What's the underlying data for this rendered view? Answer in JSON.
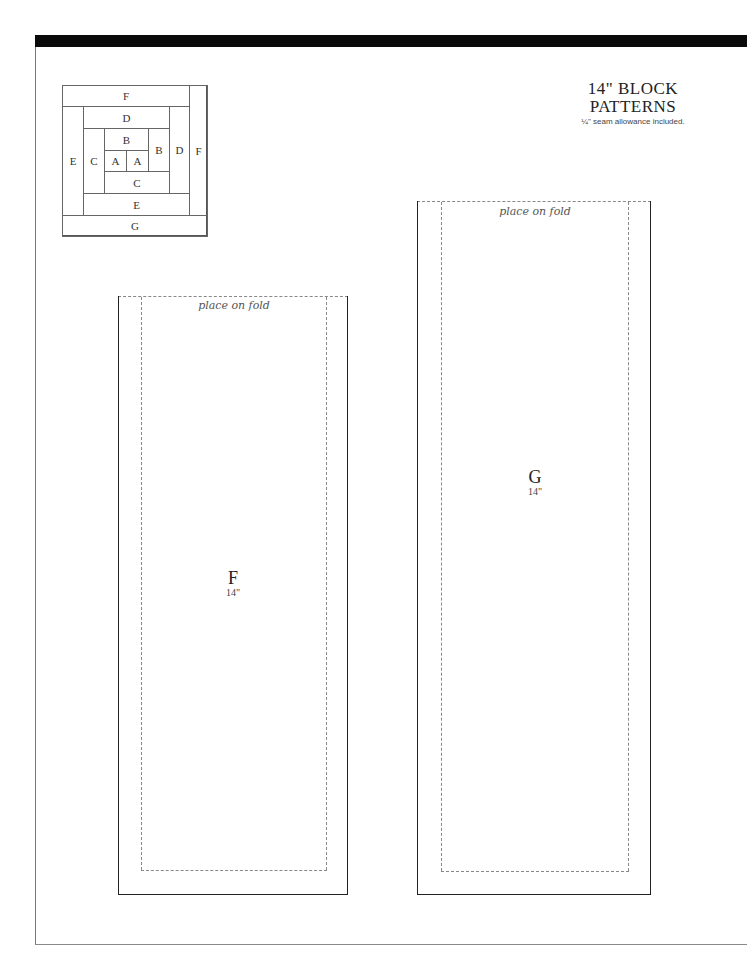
{
  "header": {
    "title_line1": "14\" BLOCK",
    "title_line2": "PATTERNS",
    "subtitle": "¼\" seam allowance included."
  },
  "block_diagram": {
    "cells": [
      {
        "label": "F",
        "name": "top-f"
      },
      {
        "label": "D",
        "name": "top-d"
      },
      {
        "label": "B",
        "name": "top-b"
      },
      {
        "label": "A",
        "name": "left-a"
      },
      {
        "label": "A",
        "name": "right-a"
      },
      {
        "label": "B",
        "name": "right-b"
      },
      {
        "label": "C",
        "name": "left-c"
      },
      {
        "label": "C",
        "name": "bottom-c"
      },
      {
        "label": "D",
        "name": "right-d"
      },
      {
        "label": "E",
        "name": "left-e"
      },
      {
        "label": "E",
        "name": "bottom-e"
      },
      {
        "label": "F",
        "name": "right-f"
      },
      {
        "label": "G",
        "name": "bottom-g"
      }
    ]
  },
  "pieces": {
    "f": {
      "fold_label": "place on fold",
      "letter": "F",
      "size": "14\""
    },
    "g": {
      "fold_label": "place on fold",
      "letter": "G",
      "size": "14\""
    }
  }
}
